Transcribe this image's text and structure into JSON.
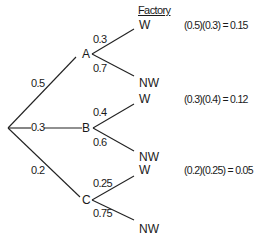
{
  "header": {
    "label": "Factory"
  },
  "root": {
    "branches": [
      "0.5",
      "0.3",
      "0.2"
    ]
  },
  "nodes": [
    {
      "name": "A",
      "prob": "0.5",
      "w_prob": "0.3",
      "nw_prob": "0.7",
      "w_label": "W",
      "nw_label": "NW",
      "equation": "(0.5)(0.3) = 0.15"
    },
    {
      "name": "B",
      "prob": "0.3",
      "w_prob": "0.4",
      "nw_prob": "0.6",
      "w_label": "W",
      "nw_label": "NW",
      "equation": "(0.3)(0.4) = 0.12"
    },
    {
      "name": "C",
      "prob": "0.2",
      "w_prob": "0.25",
      "nw_prob": "0.75",
      "w_label": "W",
      "nw_label": "NW",
      "equation": "(0.2)(0.25) = 0.05"
    }
  ]
}
